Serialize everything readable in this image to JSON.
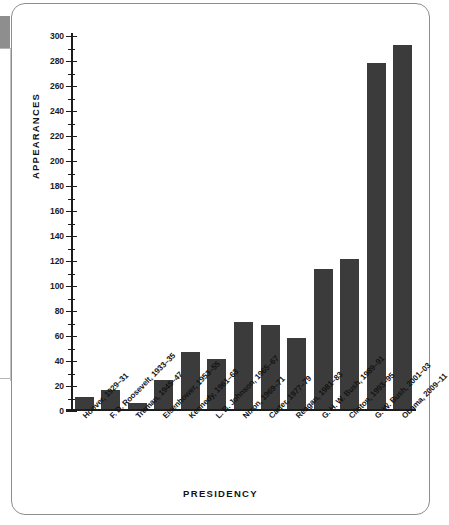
{
  "chart_data": {
    "type": "bar",
    "title": "",
    "xlabel": "PRESIDENCY",
    "ylabel": "APPEARANCES",
    "ylim": [
      0,
      300
    ],
    "ytick_step": 20,
    "yminor_step": 10,
    "grid": false,
    "legend": null,
    "bar_color": "#3b3b3b",
    "axis_color": "#1c1c1c",
    "categories": [
      "Hoover, 1929–31",
      "F. D. Roosevelt, 1933–35",
      "Truman, 1945–47",
      "Eisenhower, 1953–55",
      "Kennedy, 1961–63",
      "L. B. Johnson, 1965–67",
      "Nixon, 1969–71",
      "Carter, 1977–79",
      "Reagan, 1981–83",
      "G. H. W. Bush, 1989–91",
      "Clinton, 1993–95",
      "G. W. Bush, 2001–03",
      "Obama, 2009–11"
    ],
    "values": [
      10,
      15,
      5,
      23,
      46,
      40,
      70,
      67,
      57,
      112,
      120,
      277,
      291
    ],
    "ytick_labels": [
      "300",
      "280",
      "260",
      "240",
      "220",
      "200",
      "180",
      "160",
      "140",
      "120",
      "100",
      "80",
      "60",
      "40",
      "20",
      "0"
    ],
    "ytick_values": [
      300,
      280,
      260,
      240,
      220,
      200,
      180,
      160,
      140,
      120,
      100,
      80,
      60,
      40,
      20,
      0
    ]
  }
}
